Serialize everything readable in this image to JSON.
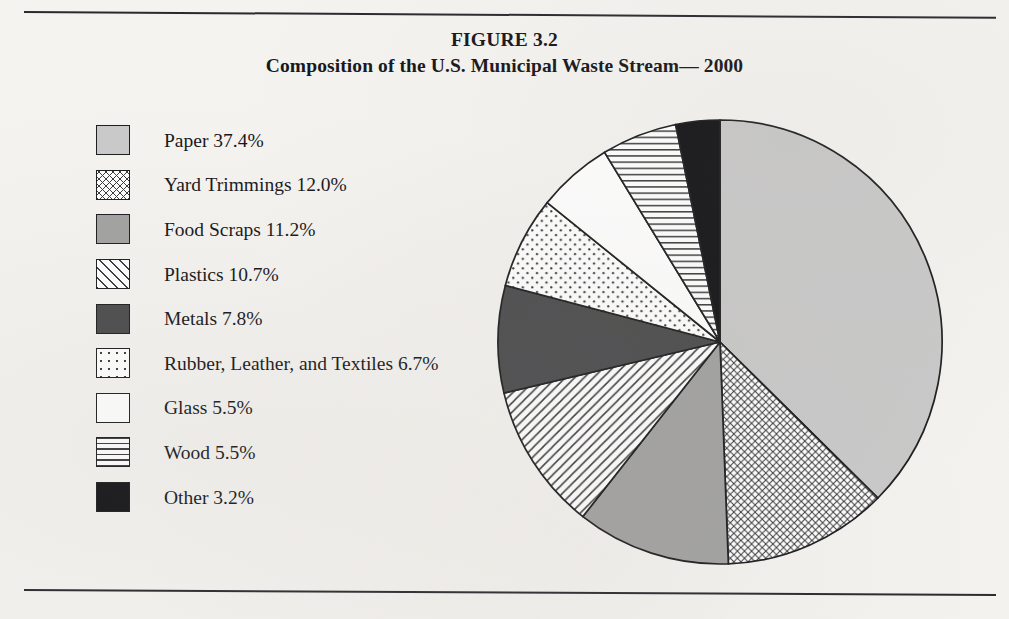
{
  "figure": {
    "number_label": "FIGURE 3.2",
    "title": "Composition of the U.S. Municipal Waste Stream— 2000"
  },
  "chart_data": {
    "type": "pie",
    "title": "Composition of the U.S. Municipal Waste Stream— 2000",
    "subtitle": "FIGURE 3.2",
    "xlabel": "",
    "ylabel": "",
    "units": "percent",
    "legend_position": "left",
    "grid": false,
    "start_angle_deg": 0,
    "direction": "clockwise",
    "categories": [
      "Paper",
      "Yard Trimmings",
      "Food Scraps",
      "Plastics",
      "Metals",
      "Rubber, Leather, and Textiles",
      "Glass",
      "Wood",
      "Other"
    ],
    "values": [
      37.4,
      12.0,
      11.2,
      10.7,
      7.8,
      6.7,
      5.5,
      5.5,
      3.2
    ],
    "total": 100.0,
    "slices": [
      {
        "label": "Paper",
        "value": 37.4,
        "label_text": "Paper 37.4%",
        "pattern": "solid-light",
        "color": "#c9c9c9"
      },
      {
        "label": "Yard Trimmings",
        "value": 12.0,
        "label_text": "Yard Trimmings 12.0%",
        "pattern": "crosshatch",
        "color": "#ffffff"
      },
      {
        "label": "Food Scraps",
        "value": 11.2,
        "label_text": "Food Scraps 11.2%",
        "pattern": "solid-medium",
        "color": "#a2a2a2"
      },
      {
        "label": "Plastics",
        "value": 10.7,
        "label_text": "Plastics 10.7%",
        "pattern": "diagonal",
        "color": "#ffffff"
      },
      {
        "label": "Metals",
        "value": 7.8,
        "label_text": "Metals 7.8%",
        "pattern": "solid-dark",
        "color": "#4b4b4d"
      },
      {
        "label": "Rubber, Leather, and Textiles",
        "value": 6.7,
        "label_text": "Rubber, Leather, and Textiles 6.7%",
        "pattern": "dotted",
        "color": "#ffffff"
      },
      {
        "label": "Glass",
        "value": 5.5,
        "label_text": "Glass 5.5%",
        "pattern": "white",
        "color": "#ffffff"
      },
      {
        "label": "Wood",
        "value": 5.5,
        "label_text": "Wood 5.5%",
        "pattern": "horizontal",
        "color": "#ffffff"
      },
      {
        "label": "Other",
        "value": 3.2,
        "label_text": "Other 3.2%",
        "pattern": "solid-black",
        "color": "#131316"
      }
    ]
  },
  "style": {
    "stroke_color": "#1d1d20",
    "page_background": "#f4f3f0",
    "text_color": "#17161a"
  }
}
